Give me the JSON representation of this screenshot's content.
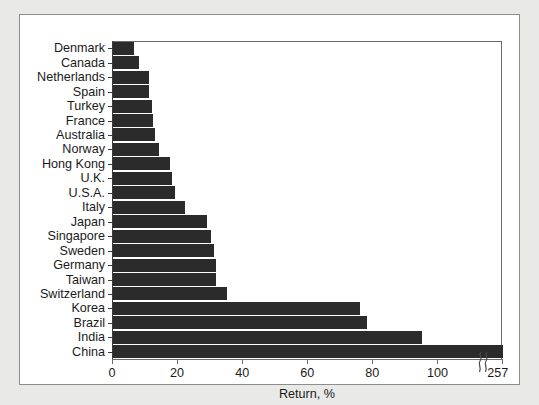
{
  "chart_data": {
    "type": "bar",
    "orientation": "horizontal",
    "title": "",
    "subtitle": "",
    "xlabel": "Return, %",
    "ylabel": "",
    "xlim": [
      0,
      257
    ],
    "xticks": [
      0,
      20,
      40,
      60,
      80,
      100,
      257
    ],
    "xtick_labels": [
      "0",
      "20",
      "40",
      "60",
      "80",
      "100",
      "257"
    ],
    "axis_break": {
      "present": true,
      "symbol": "squiggle",
      "between": [
        110,
        250
      ],
      "label": "axis-break-squiggle"
    },
    "grid": false,
    "legend": null,
    "categories": [
      "Denmark",
      "Canada",
      "Netherlands",
      "Spain",
      "Turkey",
      "France",
      "Australia",
      "Norway",
      "Hong Kong",
      "U.K.",
      "U.S.A.",
      "Italy",
      "Japan",
      "Singapore",
      "Sweden",
      "Germany",
      "Taiwan",
      "Switzerland",
      "Korea",
      "Brazil",
      "India",
      "China"
    ],
    "values": [
      6.5,
      8,
      11,
      11,
      12,
      12.3,
      13,
      14,
      17.5,
      18,
      19,
      22,
      29,
      30,
      31,
      31.5,
      31.5,
      35,
      76,
      78,
      95,
      257
    ],
    "bar_color": "#2b2b2b"
  },
  "figure": {
    "panel_background": "#ffffff",
    "page_background": "#e9e9e7",
    "frame_color": "#8d8d8d",
    "axis_color": "#6b6b6b",
    "text_color": "#1a1a1a"
  }
}
